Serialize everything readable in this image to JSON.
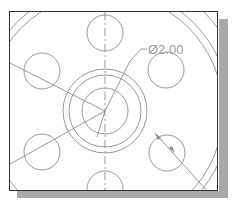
{
  "drawing": {
    "title": "CAD flange drawing view",
    "dimension_label": "Ø2.00",
    "colors": {
      "line": "#8c8c8c",
      "frame": "#333333",
      "shadow": "#a9a9a9",
      "dimension_text": "#9a9a9a"
    }
  }
}
